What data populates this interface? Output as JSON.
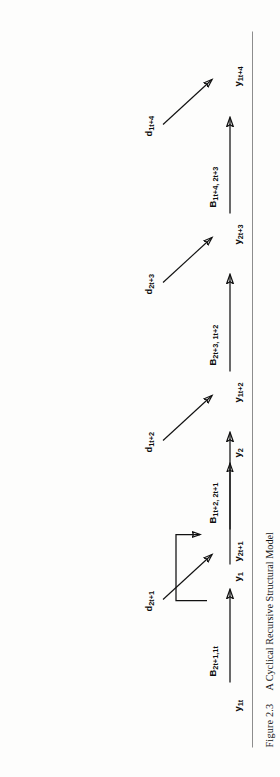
{
  "figure": {
    "caption_number": "Figure 2.3",
    "caption_title": "A Cyclical Recursive Structural Model",
    "type": "path-diagram"
  },
  "legend": {
    "variable_1": "y",
    "variable_1_sub": "1",
    "variable_2": "y",
    "variable_2_sub": "2",
    "description": "feedback loop between y1 and y2"
  },
  "diagram": {
    "nodes": [
      {
        "id": "n0",
        "base": "y",
        "sub": "1t"
      },
      {
        "id": "n1",
        "base": "y",
        "sub": "2t+1"
      },
      {
        "id": "n2",
        "base": "y",
        "sub": "1t+2"
      },
      {
        "id": "n3",
        "base": "y",
        "sub": "2t+3"
      },
      {
        "id": "n4",
        "base": "y",
        "sub": "1t+4"
      }
    ],
    "path_coefficients": [
      {
        "id": "b0",
        "base": "B",
        "sub": "2t+1,1t"
      },
      {
        "id": "b1",
        "base": "B",
        "sub": "1t+2, 2t+1"
      },
      {
        "id": "b2",
        "base": "B",
        "sub": "2t+3, 1t+2"
      },
      {
        "id": "b3",
        "base": "B",
        "sub": "1t+4, 2t+3"
      }
    ],
    "disturbances": [
      {
        "id": "d0",
        "base": "d",
        "sub": "2t+1"
      },
      {
        "id": "d1",
        "base": "d",
        "sub": "1t+2"
      },
      {
        "id": "d2",
        "base": "d",
        "sub": "2t+3"
      },
      {
        "id": "d3",
        "base": "d",
        "sub": "1t+4"
      }
    ]
  },
  "colors": {
    "ink": "#111111",
    "rule": "#8d8d8d",
    "paper": "#fdfdfc"
  }
}
